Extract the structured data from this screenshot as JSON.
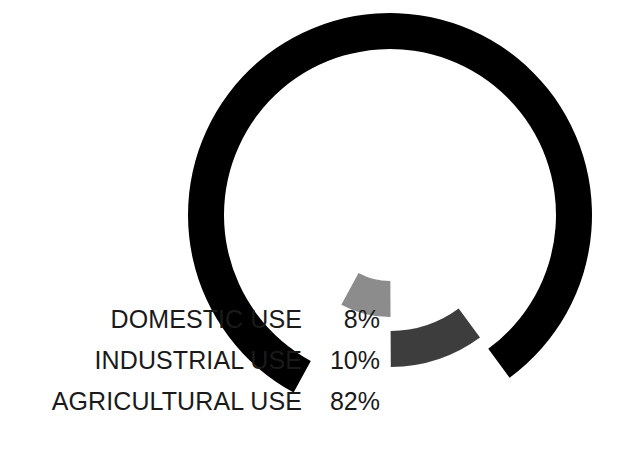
{
  "chart_data": {
    "type": "pie",
    "variant": "donut",
    "title": "",
    "subtitle": "",
    "xlabel": "",
    "ylabel": "",
    "categories": [
      "DOMESTIC USE",
      "INDUSTRIAL USE",
      "AGRICULTURAL USE"
    ],
    "values": [
      8,
      10,
      82
    ],
    "value_labels": [
      "8%",
      "10%",
      "82%"
    ],
    "unit": "%",
    "total": 100,
    "colors": [
      "#8c8c8c",
      "#3d3d3d",
      "#000000"
    ],
    "legend_position": "left-inline",
    "grid": false,
    "annotations": [],
    "slices": [
      {
        "label": "DOMESTIC USE",
        "value": 8,
        "value_label": "8%",
        "color": "#8c8c8c",
        "exploded": true
      },
      {
        "label": "INDUSTRIAL USE",
        "value": 10,
        "value_label": "10%",
        "color": "#3d3d3d",
        "exploded": true
      },
      {
        "label": "AGRICULTURAL USE",
        "value": 82,
        "value_label": "82%",
        "color": "#000000",
        "exploded": false
      }
    ]
  },
  "legend": {
    "rows": [
      {
        "label": "DOMESTIC USE",
        "value": "8%",
        "color": "#8c8c8c"
      },
      {
        "label": "INDUSTRIAL USE",
        "value": "10%",
        "color": "#3d3d3d"
      },
      {
        "label": "AGRICULTURAL USE",
        "value": "82%",
        "color": "#000000"
      }
    ]
  }
}
